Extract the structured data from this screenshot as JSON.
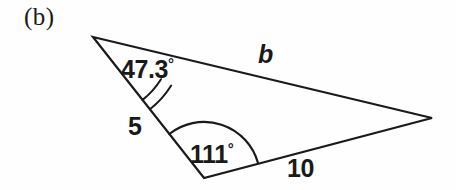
{
  "figure": {
    "part_label": "(b)",
    "background_color": "#fefefe",
    "stroke_color": "#1a1a1a",
    "text_color": "#1a1a1a",
    "width": 456,
    "height": 190
  },
  "chart_data": {
    "type": "diagram",
    "subtype": "triangle-labeled",
    "title": "(b)",
    "vertices": [
      {
        "id": "A",
        "role": "apex-top-left",
        "x": 93,
        "y": 37
      },
      {
        "id": "C",
        "role": "bottom",
        "x": 204,
        "y": 178
      },
      {
        "id": "B",
        "role": "right",
        "x": 432,
        "y": 118
      }
    ],
    "edges": [
      {
        "from": "A",
        "to": "B",
        "label": "b",
        "label_kind": "unknown",
        "label_style": "italic"
      },
      {
        "from": "A",
        "to": "C",
        "label": "5",
        "label_kind": "length",
        "value": 5
      },
      {
        "from": "C",
        "to": "B",
        "label": "10",
        "label_kind": "length",
        "value": 10
      }
    ],
    "angles": [
      {
        "at": "A",
        "label": "47.3",
        "unit": "°",
        "value": 47.3,
        "arc": {
          "radius": 92,
          "start_deg": 31.8,
          "end_deg": 51.8
        }
      },
      {
        "at": "C",
        "label": "111",
        "unit": "°",
        "value": 111,
        "arc": {
          "radius": 56,
          "start_deg": 231.8,
          "end_deg": 344.5
        }
      }
    ],
    "labels": {
      "angle_a": "47.3",
      "angle_a_degree": "°",
      "angle_c": "111",
      "angle_c_degree": "°",
      "side_b": "b",
      "side_a": "5",
      "side_c": "10"
    },
    "grid": false,
    "legend": false,
    "axes": false
  }
}
